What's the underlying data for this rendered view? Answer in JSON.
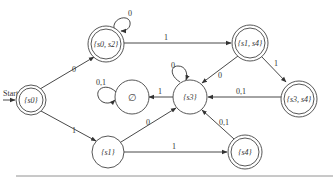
{
  "diagram": {
    "type": "deterministic finite-state automaton",
    "start_label": "Start",
    "states": [
      {
        "id": "s0",
        "label": "{s0}",
        "accepting": true,
        "start": true
      },
      {
        "id": "s0s2",
        "label": "{s0, s2}",
        "accepting": true
      },
      {
        "id": "s1s4",
        "label": "{s1, s4}",
        "accepting": true
      },
      {
        "id": "empty",
        "label": "∅",
        "accepting": false
      },
      {
        "id": "s3",
        "label": "{s3}",
        "accepting": false
      },
      {
        "id": "s3s4",
        "label": "{s3, s4}",
        "accepting": true
      },
      {
        "id": "s1",
        "label": "{s1}",
        "accepting": false
      },
      {
        "id": "s4",
        "label": "{s4}",
        "accepting": true
      }
    ],
    "transitions": [
      {
        "from": "s0",
        "to": "s0s2",
        "label": "0"
      },
      {
        "from": "s0",
        "to": "s1",
        "label": "1"
      },
      {
        "from": "s0s2",
        "to": "s0s2",
        "label": "0"
      },
      {
        "from": "s0s2",
        "to": "s1s4",
        "label": "1"
      },
      {
        "from": "s1s4",
        "to": "s3",
        "label": "0"
      },
      {
        "from": "s1s4",
        "to": "s3s4",
        "label": "1"
      },
      {
        "from": "s3s4",
        "to": "s3",
        "label": "0,1"
      },
      {
        "from": "s3",
        "to": "s3",
        "label": "0"
      },
      {
        "from": "s3",
        "to": "empty",
        "label": "1"
      },
      {
        "from": "empty",
        "to": "empty",
        "label": "0,1"
      },
      {
        "from": "s1",
        "to": "s3",
        "label": "0"
      },
      {
        "from": "s1",
        "to": "s4",
        "label": "1"
      },
      {
        "from": "s4",
        "to": "s3",
        "label": "0,1"
      }
    ]
  }
}
